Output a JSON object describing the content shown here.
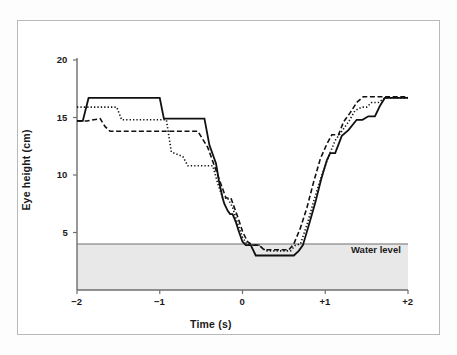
{
  "figure": {
    "background_color": "#ffffff",
    "border_color": "#b9b9b9"
  },
  "chart_data": {
    "type": "line",
    "title": "",
    "xlabel": "Time (s)",
    "ylabel": "Eye height (cm)",
    "xlim": [
      -2,
      2
    ],
    "ylim": [
      0,
      20
    ],
    "xticks": [
      -2,
      -1,
      0,
      1,
      2
    ],
    "xticklabels": [
      "−2",
      "−1",
      "0",
      "+1",
      "+2"
    ],
    "yticks": [
      5,
      10,
      15,
      20
    ],
    "yticklabels": [
      "5",
      "10",
      "15",
      "20"
    ],
    "grid": false,
    "legend": "none",
    "annotations": [
      {
        "text": "Water level",
        "x": 1.38,
        "y": 2.9,
        "color": "#1a1a1a"
      }
    ],
    "shaded_regions": [
      {
        "name": "water",
        "y_from": 0,
        "y_to": 4.0,
        "fill_color": "#e8e8e8",
        "edge_color": "#6e6e6e",
        "label": "Water level"
      }
    ],
    "series": [
      {
        "name": "trial-1",
        "linestyle": "solid",
        "color": "#111111",
        "x": [
          -2.0,
          -1.93,
          -1.86,
          -1.0,
          -0.95,
          -0.46,
          -0.4,
          -0.32,
          -0.28,
          -0.24,
          -0.22,
          -0.18,
          -0.15,
          -0.12,
          -0.08,
          -0.04,
          0.0,
          0.04,
          0.1,
          0.16,
          0.2,
          0.62,
          0.68,
          0.73,
          0.8,
          0.88,
          0.95,
          1.02,
          1.06,
          1.12,
          1.2,
          1.28,
          1.38,
          1.45,
          1.52,
          1.6,
          1.66,
          1.72,
          2.0
        ],
        "y": [
          14.7,
          14.7,
          16.7,
          16.7,
          14.9,
          14.9,
          12.6,
          11.0,
          9.3,
          8.0,
          7.5,
          6.9,
          6.6,
          6.6,
          5.9,
          5.0,
          4.2,
          3.9,
          3.9,
          3.0,
          3.0,
          3.0,
          3.4,
          3.9,
          5.6,
          7.6,
          9.6,
          11.3,
          11.9,
          11.9,
          13.4,
          13.9,
          14.8,
          14.8,
          15.1,
          15.1,
          16.0,
          16.7,
          16.7
        ]
      },
      {
        "name": "trial-2",
        "linestyle": "dotted",
        "color": "#111111",
        "x": [
          -2.0,
          -1.95,
          -1.88,
          -1.52,
          -1.46,
          -0.92,
          -0.86,
          -0.72,
          -0.66,
          -0.6,
          -0.42,
          -0.36,
          -0.3,
          -0.24,
          -0.18,
          -0.12,
          -0.06,
          0.0,
          0.05,
          0.12,
          0.2,
          0.28,
          0.34,
          0.58,
          0.64,
          0.7,
          0.78,
          0.86,
          0.95,
          1.04,
          1.12,
          1.2,
          1.28,
          1.36,
          1.44,
          1.5,
          1.56,
          1.64,
          1.72,
          2.0
        ],
        "y": [
          15.9,
          15.9,
          15.9,
          15.9,
          14.8,
          14.8,
          12.0,
          11.6,
          10.8,
          10.8,
          10.8,
          10.8,
          9.3,
          8.0,
          8.0,
          7.2,
          5.8,
          4.6,
          4.0,
          3.9,
          3.9,
          3.4,
          3.4,
          3.4,
          3.9,
          4.0,
          5.7,
          7.7,
          9.8,
          11.6,
          13.0,
          13.8,
          14.6,
          15.6,
          15.9,
          15.9,
          16.3,
          16.3,
          16.7,
          16.7
        ]
      },
      {
        "name": "trial-3",
        "linestyle": "dashed",
        "color": "#111111",
        "x": [
          -2.0,
          -1.88,
          -1.72,
          -1.66,
          -1.6,
          -0.92,
          -0.86,
          -0.54,
          -0.48,
          -0.42,
          -0.34,
          -0.26,
          -0.2,
          -0.14,
          -0.1,
          -0.05,
          0.0,
          0.06,
          0.12,
          0.2,
          0.26,
          0.56,
          0.62,
          0.7,
          0.78,
          0.86,
          0.94,
          1.02,
          1.08,
          1.16,
          1.22,
          1.3,
          1.38,
          1.46,
          1.56,
          1.64,
          2.0
        ],
        "y": [
          14.7,
          14.7,
          14.9,
          14.2,
          13.8,
          13.8,
          13.8,
          13.8,
          13.1,
          12.4,
          10.8,
          9.2,
          8.0,
          8.0,
          7.2,
          6.2,
          5.1,
          4.2,
          3.9,
          3.9,
          3.5,
          3.5,
          4.0,
          5.4,
          7.2,
          9.4,
          11.4,
          12.7,
          13.5,
          13.5,
          14.6,
          15.4,
          16.3,
          16.8,
          16.8,
          16.8,
          16.8
        ]
      }
    ]
  }
}
